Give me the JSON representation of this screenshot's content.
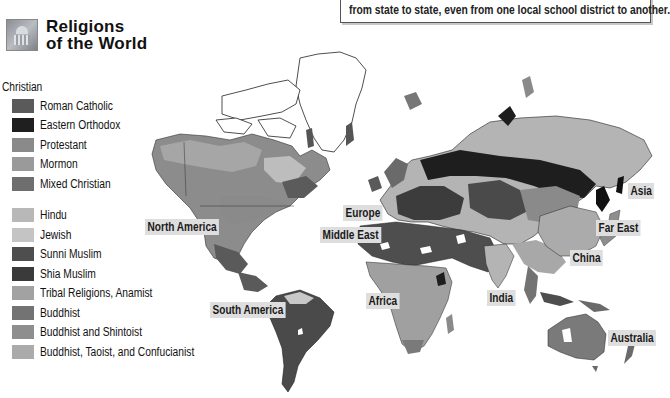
{
  "title": {
    "line1": "Religions",
    "line2": "of the World",
    "icon": "capitol-building-icon"
  },
  "note": {
    "text": "from state to state, even from one local school district to another."
  },
  "legend": {
    "group_title": "Christian",
    "christian": [
      {
        "label": "Roman Catholic",
        "color": "#5a5a5a"
      },
      {
        "label": "Eastern Orthodox",
        "color": "#1f1f1f"
      },
      {
        "label": "Protestant",
        "color": "#8a8a8a"
      },
      {
        "label": "Mormon",
        "color": "#9a9a9a"
      },
      {
        "label": "Mixed Christian",
        "color": "#6e6e6e"
      }
    ],
    "other": [
      {
        "label": "Hindu",
        "color": "#b8b8b8"
      },
      {
        "label": "Jewish",
        "color": "#c4c4c4"
      },
      {
        "label": "Sunni Muslim",
        "color": "#4e4e4e"
      },
      {
        "label": "Shia Muslim",
        "color": "#3a3a3a"
      },
      {
        "label": "Tribal Religions, Anamist",
        "color": "#a2a2a2"
      },
      {
        "label": "Buddhist",
        "color": "#737373"
      },
      {
        "label": "Buddhist and Shintoist",
        "color": "#8e8e8e"
      },
      {
        "label": "Buddhist, Taoist, and Confucianist",
        "color": "#ababab"
      }
    ]
  },
  "regions": {
    "north_america": "North America",
    "south_america": "South America",
    "europe": "Europe",
    "middle_east": "Middle East",
    "africa": "Africa",
    "india": "India",
    "china": "China",
    "far_east": "Far East",
    "asia": "Asia",
    "australia": "Australia"
  }
}
